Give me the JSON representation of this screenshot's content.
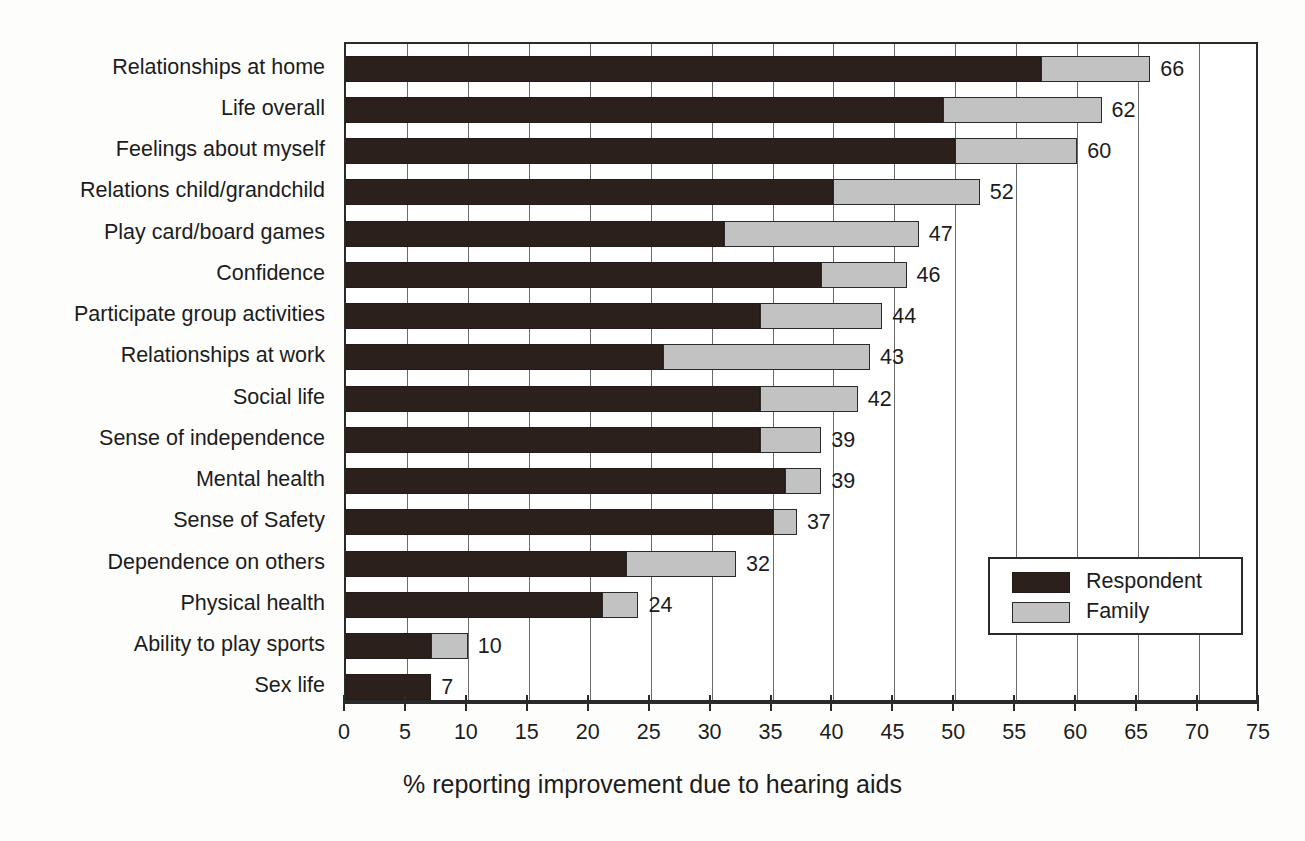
{
  "chart_data": {
    "type": "bar",
    "orientation": "horizontal",
    "stacked": true,
    "title": "",
    "xlabel": "% reporting improvement due to hearing aids",
    "ylabel": "",
    "xlim": [
      0,
      75
    ],
    "xticks": [
      0,
      5,
      10,
      15,
      20,
      25,
      30,
      35,
      40,
      45,
      50,
      55,
      60,
      65,
      70,
      75
    ],
    "grid": "vertical",
    "legend_position": "lower-right",
    "categories": [
      "Relationships at home",
      "Life overall",
      "Feelings about myself",
      "Relations child/grandchild",
      "Play card/board games",
      "Confidence",
      "Participate group activities",
      "Relationships at work",
      "Social life",
      "Sense of independence",
      "Mental health",
      "Sense of Safety",
      "Dependence on others",
      "Physical health",
      "Ability to play sports",
      "Sex life"
    ],
    "series": [
      {
        "name": "Respondent",
        "color": "#2b201c",
        "values": [
          57,
          49,
          50,
          40,
          31,
          39,
          34,
          26,
          34,
          34,
          36,
          35,
          23,
          21,
          7,
          7
        ]
      },
      {
        "name": "Family",
        "color": "#c2c2c2",
        "values": [
          9,
          13,
          10,
          12,
          16,
          7,
          10,
          17,
          8,
          5,
          3,
          2,
          9,
          3,
          3,
          0
        ]
      }
    ],
    "totals": [
      66,
      62,
      60,
      52,
      47,
      46,
      44,
      43,
      42,
      39,
      39,
      37,
      32,
      24,
      10,
      7
    ],
    "data_labels": [
      "66",
      "62",
      "60",
      "52",
      "47",
      "46",
      "44",
      "43",
      "42",
      "39",
      "39",
      "37",
      "32",
      "24",
      "10",
      "7"
    ],
    "tick_labels": [
      "0",
      "5",
      "10",
      "15",
      "20",
      "25",
      "30",
      "35",
      "40",
      "45",
      "50",
      "55",
      "60",
      "65",
      "70",
      "75"
    ]
  },
  "legend": {
    "entries": [
      {
        "label": "Respondent",
        "swatch": "respondent"
      },
      {
        "label": "Family",
        "swatch": "family"
      }
    ]
  },
  "colors": {
    "respondent": "#2b201c",
    "family": "#c2c2c2",
    "axis": "#2a2a2a",
    "grid": "#6b6b6b",
    "text": "#1c1c1c",
    "background": "#ffffff"
  }
}
